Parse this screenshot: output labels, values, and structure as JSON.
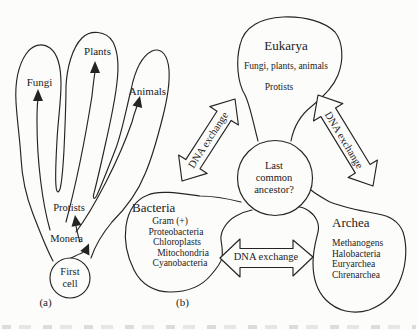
{
  "colors": {
    "ink": "#242424",
    "background": "#fcfcfa"
  },
  "panel_a": {
    "label": "(a)",
    "fungi": "Fungi",
    "plants": "Plants",
    "animals": "Animals",
    "protists": "Protists",
    "monera": "Monera",
    "first_cell": {
      "line1": "First",
      "line2": "cell"
    }
  },
  "panel_b": {
    "label": "(b)",
    "eukarya": {
      "title": "Eukarya",
      "members": "Fungi, plants, animals",
      "members2": "Protists"
    },
    "ancestor": {
      "line1": "Last",
      "line2": "common",
      "line3": "ancestor?"
    },
    "bacteria": {
      "title": "Bacteria",
      "items": [
        "Gram (+)",
        "Proteobacteria",
        "Chloroplasts",
        "Mitochondria",
        "Cyanobacteria"
      ]
    },
    "archea": {
      "title": "Archea",
      "items": [
        "Methanogens",
        "Halobacteria",
        "Euryarchea",
        "Chrenarchea"
      ]
    },
    "dna_exchange": {
      "left": "DNA exchange",
      "right": "DNA exchange",
      "bottom": "DNA exchange"
    }
  }
}
